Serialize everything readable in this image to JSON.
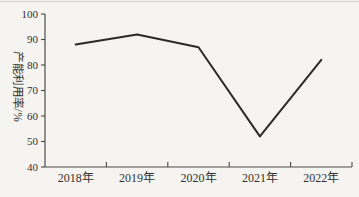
{
  "page": {
    "background": "#f5f4f0",
    "top_rule_color": "#c8c6c1"
  },
  "chart_data": {
    "type": "line",
    "title": "",
    "xlabel": "",
    "ylabel": "产能利用率/%",
    "categories": [
      "2018年",
      "2019年",
      "2020年",
      "2021年",
      "2022年"
    ],
    "values": [
      88,
      92,
      87,
      52,
      82
    ],
    "ylim": [
      40,
      100
    ],
    "yticks": [
      40,
      50,
      60,
      70,
      80,
      90,
      100
    ],
    "grid": false,
    "legend": false,
    "line_color": "#2b2a28",
    "axis_color": "#4b4a47",
    "text_color": "#33312e"
  }
}
